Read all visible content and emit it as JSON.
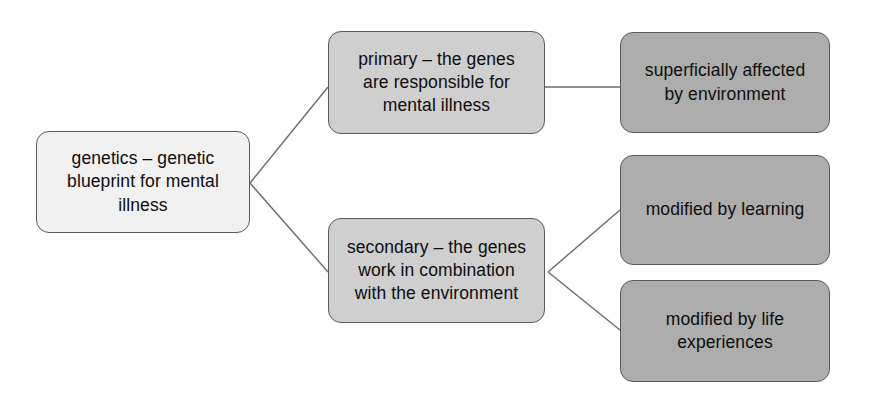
{
  "diagram": {
    "background_color": "#ffffff",
    "line_color": "#6b6b6b",
    "border_color": "#5a5a5a",
    "nodes": [
      {
        "id": "genetics",
        "label": "genetics – genetic\nblueprint for mental\nillness",
        "level": "root",
        "fill": "#f1f1f1",
        "x": 36,
        "y": 131,
        "w": 214,
        "h": 102
      },
      {
        "id": "primary",
        "label": "primary – the genes\nare responsible for\nmental illness",
        "level": "mid",
        "fill": "#cfcfcf",
        "x": 328,
        "y": 31,
        "w": 217,
        "h": 103
      },
      {
        "id": "secondary",
        "label": "secondary – the genes\nwork in combination\nwith the environment",
        "level": "mid",
        "fill": "#cfcfcf",
        "x": 328,
        "y": 218,
        "w": 217,
        "h": 105
      },
      {
        "id": "superficially-affected",
        "label": "superficially affected\nby environment",
        "level": "leaf",
        "fill": "#adadad",
        "x": 620,
        "y": 32,
        "w": 210,
        "h": 101
      },
      {
        "id": "modified-by-learning",
        "label": "modified by learning",
        "level": "leaf",
        "fill": "#adadad",
        "x": 620,
        "y": 155,
        "w": 210,
        "h": 110
      },
      {
        "id": "modified-by-life-experiences",
        "label": "modified by life\nexperiences",
        "level": "leaf",
        "fill": "#adadad",
        "x": 620,
        "y": 280,
        "w": 210,
        "h": 102
      }
    ],
    "edges": [
      {
        "id": "genetics-to-primary",
        "from": "genetics",
        "to": "primary",
        "points": "250,183 328,87"
      },
      {
        "id": "genetics-to-secondary",
        "from": "genetics",
        "to": "secondary",
        "points": "250,183 328,272"
      },
      {
        "id": "primary-to-superficially",
        "from": "primary",
        "to": "superficially-affected",
        "points": "545,87 620,87"
      },
      {
        "id": "secondary-to-learning",
        "from": "secondary",
        "to": "modified-by-learning",
        "points": "548,272 620,210"
      },
      {
        "id": "secondary-to-life",
        "from": "secondary",
        "to": "modified-by-life-experiences",
        "points": "548,272 620,330"
      }
    ]
  }
}
